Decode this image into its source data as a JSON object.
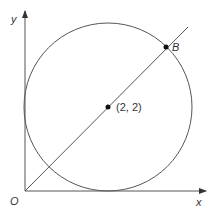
{
  "diagram": {
    "axes": {
      "x_label": "x",
      "y_label": "y",
      "origin_label": "O"
    },
    "circle": {
      "center_label": "(2, 2)",
      "center": [
        2,
        2
      ],
      "radius": 2
    },
    "line": {
      "from": "O",
      "through": "(2, 2)"
    },
    "points": [
      {
        "label": "B"
      }
    ],
    "colors": {
      "stroke": "#555555",
      "point": "#111111"
    }
  }
}
